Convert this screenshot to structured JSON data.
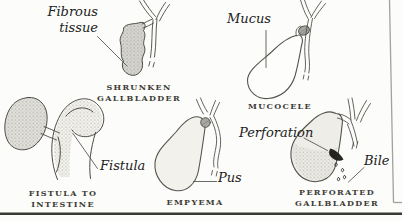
{
  "page": {
    "background": "#fcfcfa",
    "ink_color": "#4b4a44",
    "caption_color": "#3e3d38",
    "label_color": "#21211d",
    "frame_line_color": "#a3a19a",
    "bottom_rule_color": "#3a3935"
  },
  "figures": {
    "shrunken": {
      "annotation_line1": "Fibrous",
      "annotation_line2": "tissue",
      "caption_line1": "SHRUNKEN",
      "caption_line2": "GALLBLADDER"
    },
    "mucocele": {
      "annotation": "Mucus",
      "caption": "MUCOCELE"
    },
    "fistula": {
      "annotation": "Fistula",
      "caption_line1": "FISTULA TO",
      "caption_line2": "INTESTINE"
    },
    "empyema": {
      "annotation": "Pus",
      "caption": "EMPYEMA"
    },
    "perforated": {
      "annotation_perforation": "Perforation",
      "annotation_bile": "Bile",
      "caption_line1": "PERFORATED",
      "caption_line2": "GALLBLADDER"
    }
  }
}
